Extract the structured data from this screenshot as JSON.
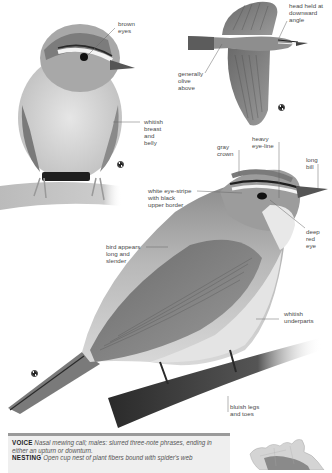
{
  "page": {
    "background": "#ffffff"
  },
  "illustrations": [
    {
      "id": "perched-front",
      "description": "bird perched facing forward on branch"
    },
    {
      "id": "flight-top",
      "description": "bird in flight seen from above"
    },
    {
      "id": "perched-side",
      "description": "bird perched in side profile on branch"
    }
  ],
  "labels": {
    "brown_eyes": "brown\neyes",
    "head_held": "head held at\ndownward\nangle",
    "generally_olive": "generally\nolive\nabove",
    "whitish_breast": "whitish\nbreast\nand\nbelly",
    "heavy_eye_line": "heavy\neye-line",
    "gray_crown": "gray\ncrown",
    "long_bill": "long\nbill",
    "white_eye_stripe": "white eye-stripe\nwith black\nupper border",
    "deep_red_eye": "deep\nred\neye",
    "bird_appears": "bird appears\nlong and\nslender",
    "whitish_underparts": "whitish\nunderparts",
    "bluish_legs": "bluish legs\nand toes"
  },
  "symbols": [
    {
      "name": "juvenile-symbol",
      "x": 117,
      "y": 161
    },
    {
      "name": "flight-symbol",
      "x": 278,
      "y": 104
    },
    {
      "name": "adult-symbol",
      "x": 31,
      "y": 370
    }
  ],
  "info": {
    "voice_heading": "VOICE",
    "voice_text": "Nasal mewing call; males: slurred three-note phrases, ending in either an upturn or downturn.",
    "nesting_heading": "NESTING",
    "nesting_text": "Open cup nest of plant fibers bound with spider's web"
  },
  "colors": {
    "info_bar": "#9a9a9a",
    "info_bg": "#efefef",
    "text": "#4a4a4a",
    "leader_line": "#666666"
  },
  "range_map": {
    "description": "North America range map"
  }
}
